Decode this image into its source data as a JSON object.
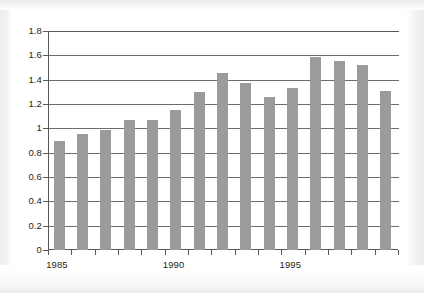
{
  "chart_data": {
    "type": "bar",
    "title": "",
    "subtitle": "",
    "xlabel": "",
    "ylabel": "",
    "categories": [
      "1985",
      "1986",
      "1987",
      "1988",
      "1989",
      "1990",
      "1991",
      "1992",
      "1993",
      "1994",
      "1995",
      "1996",
      "1997",
      "1998",
      "1999"
    ],
    "values": [
      0.9,
      0.955,
      0.985,
      1.065,
      1.065,
      1.15,
      1.295,
      1.455,
      1.37,
      1.255,
      1.335,
      1.59,
      1.555,
      1.52,
      1.305
    ],
    "ylim": [
      0,
      1.8
    ],
    "ytick_labels": [
      "0",
      "0.2",
      "0.4",
      "0.6",
      "0.8",
      "1",
      "1.2",
      "1.4",
      "1.6",
      "1.8"
    ],
    "ytick_values": [
      0,
      0.2,
      0.4,
      0.6,
      0.8,
      1,
      1.2,
      1.4,
      1.6,
      1.8
    ],
    "xtick_labels": [
      "1985",
      "1990",
      "1995"
    ],
    "xtick_label_categories": [
      "1985",
      "1990",
      "1995"
    ],
    "grid": "horizontal",
    "legend": "none",
    "series": [
      {
        "name": "",
        "color": "#9b9b9b",
        "values": [
          0.9,
          0.955,
          0.985,
          1.065,
          1.065,
          1.15,
          1.295,
          1.455,
          1.37,
          1.255,
          1.335,
          1.59,
          1.555,
          1.52,
          1.305
        ]
      }
    ],
    "colors": {
      "bar": "#9b9b9b",
      "axis": "#59595b",
      "gridline": "#6d6d70",
      "text": "#231f20",
      "plot_background": "#ffffff"
    }
  }
}
